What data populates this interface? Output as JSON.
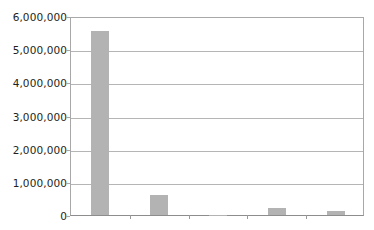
{
  "chart_data": {
    "type": "bar",
    "title": "",
    "subtitle": "",
    "xlabel": "",
    "ylabel": "",
    "categories": [
      "",
      "",
      "",
      "",
      ""
    ],
    "values": [
      5550000,
      600000,
      15000,
      200000,
      120000
    ],
    "series": [
      {
        "name": "",
        "values": [
          5550000,
          600000,
          15000,
          200000,
          120000
        ]
      }
    ],
    "ylim": [
      0,
      6000000
    ],
    "ytick_values": [
      0,
      1000000,
      2000000,
      3000000,
      4000000,
      5000000,
      6000000
    ],
    "ytick_labels": [
      "0",
      "1,000,000",
      "2,000,000",
      "3,000,000",
      "4,000,000",
      "5,000,000",
      "6,000,000"
    ],
    "xtick_labels": [
      "",
      "",
      "",
      "",
      ""
    ],
    "grid": true,
    "grid_axis": "y",
    "legend": false,
    "legend_position": "none",
    "bar_color": "#b3b3b3",
    "gridline_color": "#b5b5b5",
    "axis_color": "#a8a8a8",
    "background_color": "#ffffff",
    "text_color": "#231f20",
    "annotations": []
  }
}
